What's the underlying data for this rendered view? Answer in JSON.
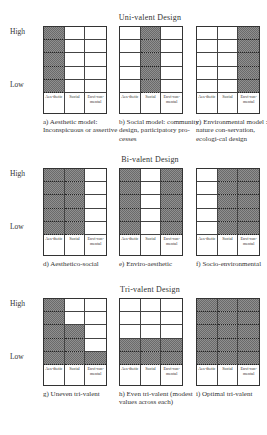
{
  "figure": {
    "axis": {
      "high": "High",
      "low": "Low"
    },
    "column_labels": [
      "Aes-thetic",
      "Social",
      "Envi-ron-mental"
    ],
    "sections": [
      {
        "title": "Uni-valent Design",
        "panels": [
          {
            "caption": "a) Aesthetic model: Inconspicuous or assertive",
            "levels": [
              5,
              0,
              0
            ]
          },
          {
            "caption": "b) Social model: community design, participatory pro-cesses",
            "levels": [
              0,
              5,
              0
            ]
          },
          {
            "caption": "c) Environmental model : nature con-servation, ecologi-cal design",
            "levels": [
              0,
              0,
              5
            ]
          }
        ]
      },
      {
        "title": "Bi-valent Design",
        "panels": [
          {
            "caption": "d) Aesthetico-social",
            "levels": [
              5,
              5,
              0
            ]
          },
          {
            "caption": "e) Enviro-aesthetic",
            "levels": [
              5,
              0,
              5
            ]
          },
          {
            "caption": "f) Socio-environmental",
            "levels": [
              0,
              5,
              5
            ]
          }
        ]
      },
      {
        "title": "Tri-valent Design",
        "panels": [
          {
            "caption": "g) Uneven tri-valent",
            "levels": [
              5,
              3,
              1
            ]
          },
          {
            "caption": "h) Even tri-valent (modest values across each)",
            "levels": [
              2,
              2,
              2
            ]
          },
          {
            "caption": "i) Optimal tri-valent",
            "levels": [
              5,
              5,
              5
            ]
          }
        ]
      }
    ]
  }
}
